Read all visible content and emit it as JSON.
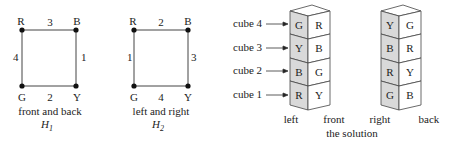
{
  "graphs": [
    {
      "id": "H1",
      "vertices": {
        "top_left": "R",
        "top_right": "B",
        "bottom_left": "G",
        "bottom_right": "Y"
      },
      "edges": {
        "top": "3",
        "right": "1",
        "bottom": "2",
        "left": "4"
      },
      "caption": "front and back",
      "label": "H",
      "subscript": "1"
    },
    {
      "id": "H2",
      "vertices": {
        "top_left": "R",
        "top_right": "B",
        "bottom_left": "G",
        "bottom_right": "Y"
      },
      "edges": {
        "top": "2",
        "right": "3",
        "bottom": "4",
        "left": "1"
      },
      "caption": "left and right",
      "label": "H",
      "subscript": "2"
    }
  ],
  "cube_labels": [
    "cube 4",
    "cube 3",
    "cube 2",
    "cube 1"
  ],
  "stack1": {
    "left_faces": [
      "G",
      "Y",
      "B",
      "R"
    ],
    "front_faces": [
      "R",
      "B",
      "G",
      "Y"
    ],
    "left_label": "left",
    "front_label": "front"
  },
  "stack2": {
    "left_faces": [
      "Y",
      "B",
      "R",
      "G"
    ],
    "front_faces": [
      "G",
      "R",
      "Y",
      "B"
    ],
    "left_label": "right",
    "front_label": "back"
  },
  "solution_caption": "the solution"
}
